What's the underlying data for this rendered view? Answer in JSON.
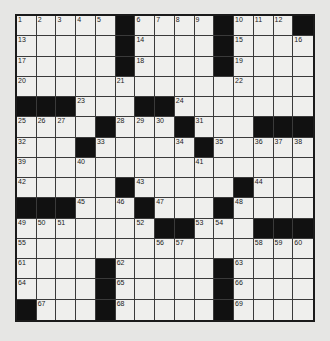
{
  "puzzle": {
    "rows": 15,
    "cols": 15,
    "colors": {
      "black": "#111111",
      "white": "#efefed",
      "background": "#e6e6e4"
    },
    "grid": [
      [
        "1",
        "2",
        "3",
        "4",
        "5",
        "#",
        "6",
        "7",
        "8",
        "9",
        "#",
        "10",
        "11",
        "12",
        "#"
      ],
      [
        "13",
        "",
        "",
        "",
        "",
        "#",
        "14",
        "",
        "",
        "",
        "#",
        "15",
        "",
        "",
        "16"
      ],
      [
        "17",
        "",
        "",
        "",
        "",
        "#",
        "18",
        "",
        "",
        "",
        "#",
        "19",
        "",
        "",
        ""
      ],
      [
        "20",
        "",
        "",
        "",
        "",
        "21",
        "",
        "",
        "",
        "",
        "",
        "22",
        "",
        "",
        ""
      ],
      [
        "#",
        "#",
        "#",
        "23",
        "",
        "",
        "#",
        "#",
        "24",
        "",
        "",
        "",
        "",
        "",
        ""
      ],
      [
        "25",
        "26",
        "27",
        "",
        "#",
        "28",
        "29",
        "30",
        "#",
        "31",
        "",
        "",
        "#",
        "#",
        "#"
      ],
      [
        "32",
        "",
        "",
        "#",
        "33",
        "",
        "",
        "",
        "34",
        "#",
        "35",
        "",
        "36",
        "37",
        "38"
      ],
      [
        "39",
        "",
        "",
        "40",
        "",
        "",
        "",
        "",
        "",
        "41",
        "",
        "",
        "",
        "",
        ""
      ],
      [
        "42",
        "",
        "",
        "",
        "",
        "#",
        "43",
        "",
        "",
        "",
        "",
        "#",
        "44",
        "",
        ""
      ],
      [
        "#",
        "#",
        "#",
        "45",
        "",
        "46",
        "#",
        "47",
        "",
        "",
        "#",
        "48",
        "",
        "",
        ""
      ],
      [
        "49",
        "50",
        "51",
        "",
        "",
        "",
        "52",
        "#",
        "#",
        "53",
        "54",
        "",
        "#",
        "#",
        "#"
      ],
      [
        "55",
        "",
        "",
        "",
        "",
        "",
        "",
        "56",
        "57",
        "",
        "",
        "",
        "58",
        "59",
        "60"
      ],
      [
        "61",
        "",
        "",
        "",
        "#",
        "62",
        "",
        "",
        "",
        "",
        "#",
        "63",
        "",
        "",
        ""
      ],
      [
        "64",
        "",
        "",
        "",
        "#",
        "65",
        "",
        "",
        "",
        "",
        "#",
        "66",
        "",
        "",
        ""
      ],
      [
        "#",
        "67",
        "",
        "",
        "#",
        "68",
        "",
        "",
        "",
        "",
        "#",
        "69",
        "",
        "",
        ""
      ]
    ]
  }
}
